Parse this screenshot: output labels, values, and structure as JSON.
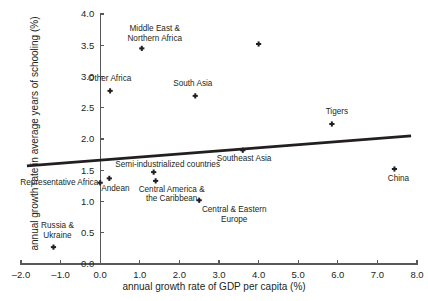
{
  "chart_data": {
    "type": "scatter",
    "title": "",
    "xlabel": "annual growth rate of GDP per capita (%)",
    "ylabel": "annual growth rate in average years of schooling (%)",
    "xlim": [
      -2.0,
      8.0
    ],
    "ylim": [
      0.0,
      4.0
    ],
    "xticks": [
      "-2.0",
      "-1.0",
      "0.0",
      "1.0",
      "2.0",
      "3.0",
      "4.0",
      "5.0",
      "6.0",
      "7.0",
      "8.0"
    ],
    "yticks": [
      "0.0",
      "0.5",
      "1.0",
      "1.5",
      "2.0",
      "2.5",
      "3.0",
      "3.5",
      "4.0"
    ],
    "grid": false,
    "legend": "none",
    "points": [
      {
        "label": "Middle East &\nNorthern Africa",
        "x": 1.05,
        "y": 3.45,
        "label_dx": -30,
        "label_dy": -24,
        "label_w": 86,
        "label_align": "center"
      },
      {
        "label": "",
        "x": 4.0,
        "y": 3.52,
        "label_dx": 0,
        "label_dy": 0,
        "label_w": 0,
        "label_align": "center"
      },
      {
        "label": "Other Africa",
        "x": 0.25,
        "y": 2.77,
        "label_dx": -22,
        "label_dy": -17,
        "label_w": 60,
        "label_align": "left"
      },
      {
        "label": "South Asia",
        "x": 2.4,
        "y": 2.69,
        "label_dx": -22,
        "label_dy": -17,
        "label_w": 58,
        "label_align": "left"
      },
      {
        "label": "Tigers",
        "x": 5.85,
        "y": 2.24,
        "label_dx": -13,
        "label_dy": -17,
        "label_w": 36,
        "label_align": "center"
      },
      {
        "label": "Semi-industrialized countries",
        "x": 1.35,
        "y": 1.47,
        "label_dx": -48,
        "label_dy": -12,
        "label_w": 124,
        "label_align": "center"
      },
      {
        "label": "Southeast Asia",
        "x": 3.6,
        "y": 1.82,
        "label_dx": -26,
        "label_dy": 4,
        "label_w": 74,
        "label_align": "left"
      },
      {
        "label": "Central America &\nthe Caribbean",
        "x": 1.4,
        "y": 1.33,
        "label_dx": -30,
        "label_dy": 4,
        "label_w": 92,
        "label_align": "center"
      },
      {
        "label": "Representative Africa",
        "x": 0.0,
        "y": 1.3,
        "label_dx": -92,
        "label_dy": -5,
        "label_w": 90,
        "label_align": "right"
      },
      {
        "label": "Andean",
        "x": 0.23,
        "y": 1.37,
        "label_dx": -8,
        "label_dy": 6,
        "label_w": 40,
        "label_align": "left"
      },
      {
        "label": "Central & Eastern\nEurope",
        "x": 2.5,
        "y": 1.02,
        "label_dx": -8,
        "label_dy": 5,
        "label_w": 86,
        "label_align": "center"
      },
      {
        "label": "China",
        "x": 7.43,
        "y": 1.52,
        "label_dx": -13,
        "label_dy": 5,
        "label_w": 34,
        "label_align": "center"
      },
      {
        "label": "Russia &\nUkraine",
        "x": -1.18,
        "y": 0.27,
        "label_dx": -22,
        "label_dy": -26,
        "label_w": 52,
        "label_align": "center"
      }
    ],
    "trend_line": {
      "x_start": -1.85,
      "y_start": 1.57,
      "x_end": 7.85,
      "y_end": 2.05,
      "color": "#231f20"
    },
    "colors": {
      "marker": "#231f20",
      "axis": "#58595b",
      "trend": "#231f20",
      "background": "#ffffff"
    }
  }
}
